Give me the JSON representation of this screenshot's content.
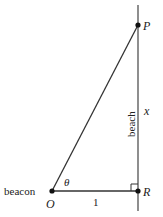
{
  "diagram": {
    "points": {
      "P": {
        "label": "P",
        "x": 138,
        "y": 25
      },
      "O": {
        "label": "O",
        "x": 52,
        "y": 191
      },
      "R": {
        "label": "R",
        "x": 138,
        "y": 191
      }
    },
    "labels": {
      "beacon": "beacon",
      "beach": "beach",
      "theta": "θ",
      "x": "x",
      "one": "1"
    },
    "colors": {
      "line": "#333333",
      "point": "#111111",
      "text": "#222222"
    }
  }
}
